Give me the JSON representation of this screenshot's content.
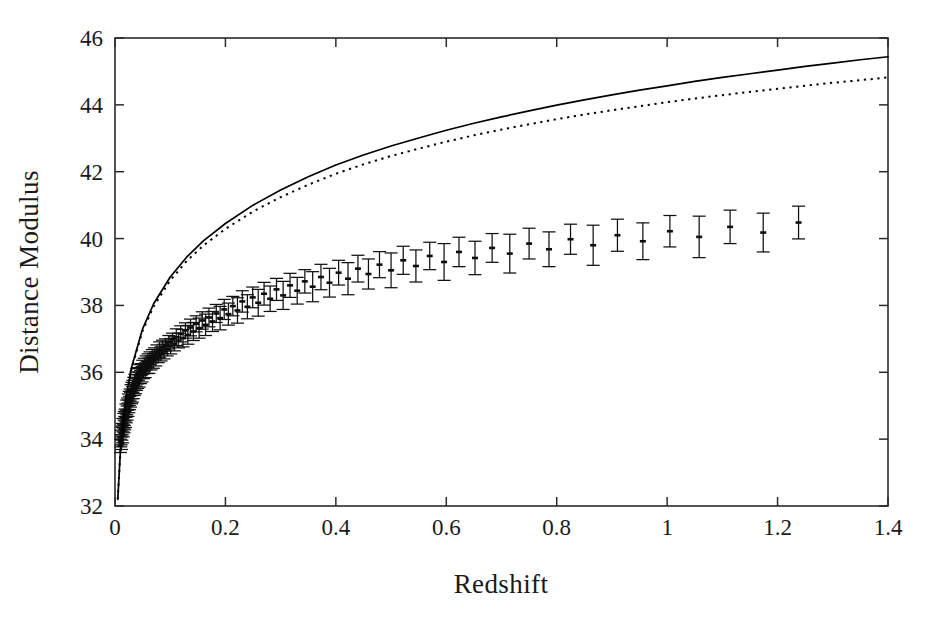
{
  "figure": {
    "width": 937,
    "height": 635,
    "background": "#ffffff",
    "ink_color": "#1a1a1a"
  },
  "chart_data": {
    "type": "scatter",
    "title": "",
    "subtitle": "",
    "xlabel": "Redshift",
    "ylabel": "Distance Modulus",
    "xlim": [
      0,
      1.4
    ],
    "ylim": [
      32,
      46
    ],
    "xticks": [
      0,
      0.2,
      0.4,
      0.6,
      0.8,
      1,
      1.2,
      1.4
    ],
    "xtick_labels": [
      "0",
      "0.2",
      "0.4",
      "0.6",
      "0.8",
      "1",
      "1.2",
      "1.4"
    ],
    "yticks": [
      32,
      34,
      36,
      38,
      40,
      42,
      44,
      46
    ],
    "ytick_labels": [
      "32",
      "34",
      "36",
      "38",
      "40",
      "42",
      "44",
      "46"
    ],
    "grid": false,
    "legend": "none",
    "frame": "box-all-four-sides-inward-ticks",
    "series": [
      {
        "name": "model-solid",
        "style": "solid",
        "color": "#000000",
        "description": "upper model curve (accelerating universe fit)",
        "x": [
          0.005,
          0.01,
          0.02,
          0.03,
          0.05,
          0.07,
          0.1,
          0.13,
          0.16,
          0.2,
          0.25,
          0.3,
          0.35,
          0.4,
          0.45,
          0.5,
          0.55,
          0.6,
          0.65,
          0.7,
          0.75,
          0.8,
          0.85,
          0.9,
          0.95,
          1.0,
          1.05,
          1.1,
          1.15,
          1.2,
          1.25,
          1.3,
          1.35,
          1.4
        ],
        "y": [
          32.2,
          33.7,
          35.25,
          36.15,
          37.3,
          38.05,
          38.85,
          39.45,
          39.93,
          40.45,
          41.0,
          41.45,
          41.85,
          42.2,
          42.5,
          42.77,
          43.01,
          43.24,
          43.45,
          43.64,
          43.82,
          43.99,
          44.15,
          44.3,
          44.44,
          44.57,
          44.7,
          44.82,
          44.93,
          45.04,
          45.15,
          45.25,
          45.35,
          45.44
        ]
      },
      {
        "name": "model-dotted",
        "style": "dotted",
        "color": "#000000",
        "description": "lower model curve (decelerating / matter-only fit)",
        "x": [
          0.005,
          0.01,
          0.02,
          0.03,
          0.05,
          0.07,
          0.1,
          0.13,
          0.16,
          0.2,
          0.25,
          0.3,
          0.35,
          0.4,
          0.45,
          0.5,
          0.55,
          0.6,
          0.65,
          0.7,
          0.75,
          0.8,
          0.85,
          0.9,
          0.95,
          1.0,
          1.05,
          1.1,
          1.15,
          1.2,
          1.25,
          1.3,
          1.35,
          1.4
        ],
        "y": [
          32.2,
          33.7,
          35.23,
          36.11,
          37.24,
          37.97,
          38.75,
          39.33,
          39.79,
          40.29,
          40.81,
          41.24,
          41.61,
          41.94,
          42.22,
          42.47,
          42.69,
          42.9,
          43.09,
          43.26,
          43.42,
          43.57,
          43.71,
          43.84,
          43.96,
          44.08,
          44.19,
          44.29,
          44.39,
          44.48,
          44.57,
          44.66,
          44.74,
          44.82
        ]
      }
    ],
    "points_note": "Type Ia supernova measurements with vertical 1-sigma error bars; dense cluster at z < 0.1, sparse high-redshift sample out to z = 1.4",
    "points": [
      [
        0.01,
        33.8,
        0.2
      ],
      [
        0.0105,
        33.95,
        0.18
      ],
      [
        0.0112,
        34.05,
        0.22
      ],
      [
        0.0118,
        33.88,
        0.19
      ],
      [
        0.0124,
        34.18,
        0.21
      ],
      [
        0.013,
        34.3,
        0.17
      ],
      [
        0.0136,
        34.12,
        0.23
      ],
      [
        0.0142,
        34.42,
        0.2
      ],
      [
        0.015,
        34.25,
        0.18
      ],
      [
        0.0158,
        34.55,
        0.22
      ],
      [
        0.0164,
        34.38,
        0.19
      ],
      [
        0.017,
        34.62,
        0.21
      ],
      [
        0.0177,
        34.48,
        0.2
      ],
      [
        0.0184,
        34.72,
        0.18
      ],
      [
        0.019,
        34.58,
        0.23
      ],
      [
        0.0198,
        34.85,
        0.2
      ],
      [
        0.0205,
        34.68,
        0.19
      ],
      [
        0.0212,
        34.95,
        0.22
      ],
      [
        0.022,
        34.78,
        0.21
      ],
      [
        0.0228,
        35.05,
        0.18
      ],
      [
        0.0235,
        34.88,
        0.2
      ],
      [
        0.0243,
        35.12,
        0.23
      ],
      [
        0.025,
        34.98,
        0.19
      ],
      [
        0.0258,
        35.22,
        0.21
      ],
      [
        0.0266,
        35.08,
        0.2
      ],
      [
        0.0274,
        35.32,
        0.18
      ],
      [
        0.0282,
        35.18,
        0.22
      ],
      [
        0.029,
        35.42,
        0.21
      ],
      [
        0.0298,
        35.25,
        0.19
      ],
      [
        0.0306,
        35.5,
        0.2
      ],
      [
        0.0315,
        35.34,
        0.23
      ],
      [
        0.0324,
        35.58,
        0.18
      ],
      [
        0.0332,
        35.42,
        0.21
      ],
      [
        0.034,
        35.65,
        0.2
      ],
      [
        0.035,
        35.5,
        0.19
      ],
      [
        0.036,
        35.72,
        0.22
      ],
      [
        0.037,
        35.56,
        0.2
      ],
      [
        0.038,
        35.8,
        0.21
      ],
      [
        0.039,
        35.64,
        0.18
      ],
      [
        0.04,
        35.88,
        0.23
      ],
      [
        0.0412,
        35.72,
        0.2
      ],
      [
        0.0424,
        35.95,
        0.19
      ],
      [
        0.0436,
        35.78,
        0.22
      ],
      [
        0.0448,
        36.02,
        0.21
      ],
      [
        0.046,
        35.86,
        0.2
      ],
      [
        0.0474,
        36.08,
        0.18
      ],
      [
        0.0488,
        35.94,
        0.23
      ],
      [
        0.0502,
        36.15,
        0.21
      ],
      [
        0.0516,
        36.0,
        0.19
      ],
      [
        0.0532,
        36.22,
        0.2
      ],
      [
        0.0548,
        36.06,
        0.22
      ],
      [
        0.0564,
        36.28,
        0.21
      ],
      [
        0.058,
        36.14,
        0.18
      ],
      [
        0.0598,
        36.35,
        0.2
      ],
      [
        0.0616,
        36.2,
        0.23
      ],
      [
        0.0634,
        36.42,
        0.19
      ],
      [
        0.0654,
        36.28,
        0.21
      ],
      [
        0.0674,
        36.48,
        0.2
      ],
      [
        0.0694,
        36.34,
        0.22
      ],
      [
        0.0716,
        36.55,
        0.18
      ],
      [
        0.0738,
        36.4,
        0.21
      ],
      [
        0.076,
        36.62,
        0.2
      ],
      [
        0.0784,
        36.48,
        0.19
      ],
      [
        0.0808,
        36.68,
        0.23
      ],
      [
        0.0834,
        36.55,
        0.21
      ],
      [
        0.086,
        36.76,
        0.2
      ],
      [
        0.0888,
        36.62,
        0.22
      ],
      [
        0.0916,
        36.82,
        0.18
      ],
      [
        0.0946,
        36.7,
        0.21
      ],
      [
        0.0976,
        36.9,
        0.2
      ],
      [
        0.1008,
        36.78,
        0.23
      ],
      [
        0.104,
        36.98,
        0.19
      ],
      [
        0.1075,
        36.85,
        0.21
      ],
      [
        0.111,
        37.05,
        0.25
      ],
      [
        0.115,
        36.95,
        0.22
      ],
      [
        0.119,
        37.15,
        0.24
      ],
      [
        0.1232,
        37.02,
        0.26
      ],
      [
        0.1276,
        37.25,
        0.23
      ],
      [
        0.132,
        37.12,
        0.28
      ],
      [
        0.1368,
        37.34,
        0.25
      ],
      [
        0.1418,
        37.22,
        0.27
      ],
      [
        0.147,
        37.45,
        0.24
      ],
      [
        0.1524,
        37.32,
        0.3
      ],
      [
        0.158,
        37.55,
        0.26
      ],
      [
        0.164,
        37.42,
        0.32
      ],
      [
        0.1702,
        37.64,
        0.28
      ],
      [
        0.1766,
        37.52,
        0.3
      ],
      [
        0.1834,
        37.76,
        0.27
      ],
      [
        0.1904,
        37.62,
        0.35
      ],
      [
        0.1978,
        37.88,
        0.3
      ],
      [
        0.2054,
        37.74,
        0.33
      ],
      [
        0.2134,
        37.98,
        0.29
      ],
      [
        0.2218,
        37.85,
        0.38
      ],
      [
        0.2306,
        38.12,
        0.32
      ],
      [
        0.2398,
        37.96,
        0.36
      ],
      [
        0.2494,
        38.24,
        0.31
      ],
      [
        0.2594,
        38.08,
        0.4
      ],
      [
        0.27,
        38.35,
        0.34
      ],
      [
        0.281,
        38.2,
        0.38
      ],
      [
        0.2925,
        38.48,
        0.33
      ],
      [
        0.3045,
        38.3,
        0.42
      ],
      [
        0.317,
        38.6,
        0.36
      ],
      [
        0.33,
        38.44,
        0.4
      ],
      [
        0.3438,
        38.72,
        0.35
      ],
      [
        0.358,
        38.56,
        0.45
      ],
      [
        0.373,
        38.85,
        0.38
      ],
      [
        0.3885,
        38.68,
        0.43
      ],
      [
        0.405,
        38.98,
        0.37
      ],
      [
        0.422,
        38.8,
        0.48
      ],
      [
        0.44,
        39.1,
        0.4
      ],
      [
        0.459,
        38.94,
        0.45
      ],
      [
        0.479,
        39.22,
        0.39
      ],
      [
        0.5,
        39.05,
        0.52
      ],
      [
        0.522,
        39.35,
        0.42
      ],
      [
        0.545,
        39.18,
        0.48
      ],
      [
        0.57,
        39.48,
        0.41
      ],
      [
        0.596,
        39.3,
        0.55
      ],
      [
        0.623,
        39.6,
        0.44
      ],
      [
        0.652,
        39.42,
        0.5
      ],
      [
        0.683,
        39.72,
        0.43
      ],
      [
        0.715,
        39.55,
        0.58
      ],
      [
        0.75,
        39.85,
        0.46
      ],
      [
        0.786,
        39.68,
        0.52
      ],
      [
        0.825,
        39.98,
        0.45
      ],
      [
        0.866,
        39.8,
        0.6
      ],
      [
        0.91,
        40.1,
        0.48
      ],
      [
        0.956,
        39.92,
        0.55
      ],
      [
        1.005,
        40.22,
        0.47
      ],
      [
        1.058,
        40.05,
        0.62
      ],
      [
        1.114,
        40.35,
        0.5
      ],
      [
        1.174,
        40.18,
        0.58
      ],
      [
        1.238,
        40.48,
        0.49
      ]
    ]
  },
  "axes": {
    "x_title": "Redshift",
    "y_title": "Distance Modulus"
  }
}
